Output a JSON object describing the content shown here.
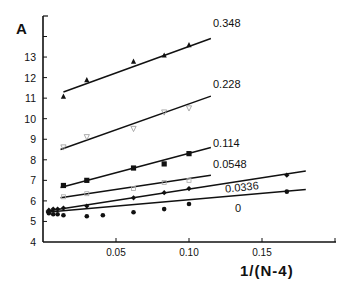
{
  "chart_data": {
    "type": "scatter",
    "title": "",
    "panel_label": "A",
    "xlabel": "1/(N-4)",
    "ylabel": "",
    "xlim": [
      0,
      0.2
    ],
    "ylim": [
      4,
      14
    ],
    "x_ticks": [
      "0.05",
      "0.10",
      "0.15"
    ],
    "y_ticks": [
      "4",
      "5",
      "6",
      "7",
      "8",
      "9",
      "10",
      "11",
      "12",
      "13"
    ],
    "grid": false,
    "legend": "inline labels at line ends",
    "series": [
      {
        "name": "0.348",
        "marker": "filled-triangle",
        "points": [
          [
            0.014,
            11.1
          ],
          [
            0.03,
            11.9
          ],
          [
            0.062,
            12.8
          ],
          [
            0.083,
            13.1
          ],
          [
            0.1,
            13.6
          ]
        ],
        "fit_line": [
          [
            0.014,
            11.3
          ],
          [
            0.115,
            13.9
          ]
        ]
      },
      {
        "name": "0.228",
        "marker": "open-triangle",
        "points": [
          [
            0.014,
            8.6
          ],
          [
            0.03,
            9.1
          ],
          [
            0.062,
            9.5
          ],
          [
            0.083,
            10.3
          ],
          [
            0.1,
            10.5
          ]
        ],
        "fit_line": [
          [
            0.012,
            8.5
          ],
          [
            0.115,
            11.1
          ]
        ]
      },
      {
        "name": "0.114",
        "marker": "filled-square",
        "points": [
          [
            0.014,
            6.75
          ],
          [
            0.03,
            7.0
          ],
          [
            0.062,
            7.6
          ],
          [
            0.083,
            7.8
          ],
          [
            0.1,
            8.3
          ]
        ],
        "fit_line": [
          [
            0.012,
            6.65
          ],
          [
            0.115,
            8.6
          ]
        ]
      },
      {
        "name": "0.0548",
        "marker": "open-circle",
        "points": [
          [
            0.014,
            6.2
          ],
          [
            0.03,
            6.35
          ],
          [
            0.062,
            6.6
          ],
          [
            0.083,
            6.9
          ],
          [
            0.1,
            7.0
          ]
        ],
        "fit_line": [
          [
            0.012,
            6.15
          ],
          [
            0.115,
            7.25
          ]
        ]
      },
      {
        "name": "0.0336",
        "marker": "filled-diamond",
        "points": [
          [
            0.004,
            5.55
          ],
          [
            0.007,
            5.6
          ],
          [
            0.01,
            5.6
          ],
          [
            0.014,
            5.65
          ],
          [
            0.03,
            5.75
          ],
          [
            0.062,
            6.15
          ],
          [
            0.083,
            6.4
          ],
          [
            0.1,
            6.6
          ],
          [
            0.167,
            7.25
          ]
        ],
        "fit_line": [
          [
            0.002,
            5.5
          ],
          [
            0.18,
            7.45
          ]
        ]
      },
      {
        "name": "0",
        "marker": "filled-circle",
        "points": [
          [
            0.004,
            5.4
          ],
          [
            0.007,
            5.35
          ],
          [
            0.01,
            5.35
          ],
          [
            0.014,
            5.3
          ],
          [
            0.03,
            5.25
          ],
          [
            0.041,
            5.3
          ],
          [
            0.062,
            5.45
          ],
          [
            0.083,
            5.6
          ],
          [
            0.1,
            5.85
          ],
          [
            0.167,
            6.45
          ]
        ],
        "fit_line": [
          [
            0.002,
            5.45
          ],
          [
            0.18,
            6.55
          ]
        ]
      }
    ]
  }
}
